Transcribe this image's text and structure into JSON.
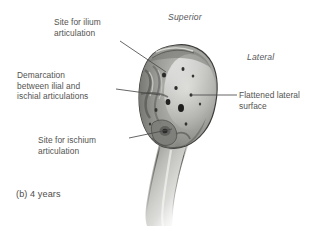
{
  "figure": {
    "caption": "(b) 4 years",
    "background_color": "#ffffff",
    "text_color": "#53534f",
    "leader_line_color": "#4a4a4a"
  },
  "orientation_labels": [
    {
      "name": "superior",
      "text": "Superior"
    },
    {
      "name": "lateral",
      "text": "Lateral"
    }
  ],
  "annotations": [
    {
      "name": "site-for-ilium-articulation",
      "text": "Site for ilium\narticulation",
      "leader": {
        "x1": 120,
        "y1": 41,
        "x2": 166,
        "y2": 72
      }
    },
    {
      "name": "demarcation-between-ilial-and-ischial-articulations",
      "text": "Demarcation\nbetween ilial and\nischial articulations",
      "leader": {
        "x1": 116,
        "y1": 89,
        "x2": 160,
        "y2": 95
      }
    },
    {
      "name": "site-for-ischium-articulation",
      "text": "Site for ischium\narticulation",
      "leader": {
        "x1": 129,
        "y1": 138,
        "x2": 172,
        "y2": 129
      }
    },
    {
      "name": "flattened-lateral-surface",
      "text": "Flattened lateral\nsurface",
      "leader": {
        "x1": 237,
        "y1": 95,
        "x2": 191,
        "y2": 95
      }
    }
  ],
  "specimen": {
    "name": "pubis-bone-4-years",
    "body_fill": "#9a9a97",
    "shaft_fill": "#c8c8c6",
    "outline": "#3f3f3e",
    "pitted_texture_side": "left",
    "smooth_surface_side": "right"
  }
}
